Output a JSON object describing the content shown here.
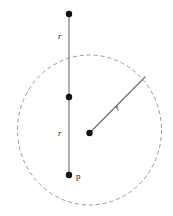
{
  "figure": {
    "background_color": "#ffffff",
    "width": 173,
    "height": 216,
    "circle": {
      "name": "dashed-circle",
      "center_x": 89.5,
      "center_y": 130,
      "radius_x": 72,
      "radius_y": 75,
      "stroke_color": "#9a9a9a",
      "stroke_width": 1,
      "dash_pattern": "4 3",
      "fill": "none"
    },
    "vertical_line": {
      "name": "vertical-diameter-line",
      "x": 69,
      "y_top": 14,
      "y_bottom": 175,
      "stroke_color": "#8c8c8c",
      "stroke_width": 1.4
    },
    "radius_line": {
      "name": "radius-line",
      "x1": 89.5,
      "y1": 133,
      "x2": 145,
      "y2": 77,
      "stroke_color": "#6e6e76",
      "stroke_width": 1.2
    },
    "dots": [
      {
        "name": "top-point-dot",
        "x": 69,
        "y": 14,
        "r": 3.2,
        "color": "#111111"
      },
      {
        "name": "middle-point-dot",
        "x": 69,
        "y": 97,
        "r": 3.2,
        "color": "#111111"
      },
      {
        "name": "bottom-point-p-dot",
        "x": 69,
        "y": 175,
        "r": 3.2,
        "color": "#111111"
      },
      {
        "name": "circle-center-dot",
        "x": 89.5,
        "y": 133,
        "r": 3.2,
        "color": "#111111"
      }
    ],
    "labels": [
      {
        "name": "label-r-upper",
        "text": "r",
        "x": 58,
        "y": 39,
        "style": "math"
      },
      {
        "name": "label-r-lower",
        "text": "r",
        "x": 58,
        "y": 136,
        "style": "math"
      },
      {
        "name": "label-r-radius",
        "text": "r",
        "x": 118,
        "y": 111,
        "style": "math",
        "rotate": -45
      },
      {
        "name": "label-point-p",
        "text": "p",
        "x": 76,
        "y": 179,
        "style": "plain"
      }
    ]
  }
}
